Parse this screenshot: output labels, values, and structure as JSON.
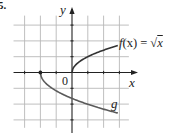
{
  "figure": {
    "problem_number": "5.",
    "axis_labels": {
      "x": "x",
      "y": "y",
      "origin": "0"
    },
    "curve_labels": {
      "f_prefix": "f",
      "f_arg": "(x) = √",
      "f_radicand": "x",
      "g": "g"
    }
  },
  "chart_data": {
    "type": "line",
    "title": "",
    "xlabel": "x",
    "ylabel": "y",
    "grid": true,
    "grid_spacing": 1,
    "xlim": [
      -3.7,
      3.6
    ],
    "ylim": [
      -3.5,
      3.6
    ],
    "series": [
      {
        "name": "f(x) = √x",
        "color": "#333333",
        "points": [
          [
            0,
            0
          ],
          [
            0.25,
            0.5
          ],
          [
            0.5,
            0.71
          ],
          [
            1,
            1
          ],
          [
            1.5,
            1.22
          ],
          [
            2,
            1.41
          ],
          [
            2.5,
            1.58
          ],
          [
            2.9,
            1.7
          ]
        ]
      },
      {
        "name": "g",
        "color": "#555555",
        "start_point": [
          -2,
          0
        ],
        "points": [
          [
            -2,
            0
          ],
          [
            -1.75,
            -0.58
          ],
          [
            -1.5,
            -0.82
          ],
          [
            -1,
            -1.16
          ],
          [
            -0.5,
            -1.42
          ],
          [
            0,
            -1.64
          ],
          [
            1,
            -2.01
          ],
          [
            2,
            -2.32
          ],
          [
            2.9,
            -2.6
          ]
        ]
      }
    ],
    "annotations": [
      "f(x) = √x",
      "g",
      "0"
    ]
  },
  "layout": {
    "origin_px": [
      72,
      72.5
    ],
    "unit_px": 15.8,
    "grid_color": "#b8b8b8",
    "axis_color": "#222222",
    "f_color": "#333333",
    "g_color": "#5a5a5a"
  }
}
